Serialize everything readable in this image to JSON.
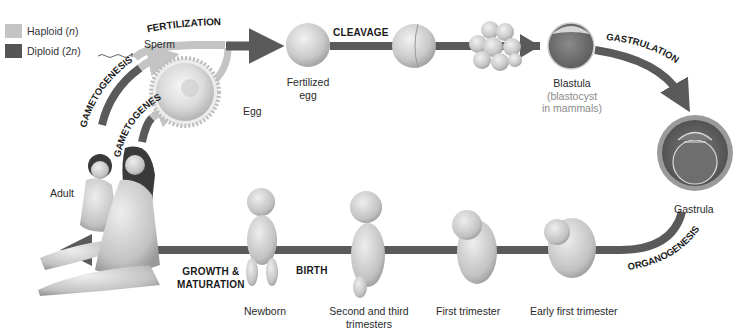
{
  "legend": {
    "items": [
      {
        "label_pre": "Haploid (",
        "label_var": "n",
        "label_post": ")",
        "color": "#c4c4c4"
      },
      {
        "label_pre": "Diploid (2",
        "label_var": "n",
        "label_post": ")",
        "color": "#555555"
      }
    ]
  },
  "colors": {
    "haploid": "#c4c4c4",
    "diploid": "#5a5a5a",
    "background": "#ffffff"
  },
  "processes": {
    "gametogenesis_male": "GAMETOGENESIS",
    "gametogenesis_female": "GAMETOGENESIS",
    "fertilization": "FERTILIZATION",
    "cleavage": "CLEAVAGE",
    "gastrulation": "GASTRULATION",
    "organogenesis": "ORGANOGENESIS",
    "birth": "BIRTH",
    "growth_line1": "GROWTH &",
    "growth_line2": "MATURATION"
  },
  "stages": {
    "sperm": "Sperm",
    "egg": "Egg",
    "fertilized_egg_line1": "Fertilized",
    "fertilized_egg_line2": "egg",
    "blastula": "Blastula",
    "blastula_note_line1": "(blastocyst",
    "blastula_note_line2": "in mammals)",
    "gastrula": "Gastrula",
    "early_first_trimester": "Early first trimester",
    "first_trimester": "First trimester",
    "second_third_line1": "Second and third",
    "second_third_line2": "trimesters",
    "newborn": "Newborn",
    "adult": "Adult"
  }
}
